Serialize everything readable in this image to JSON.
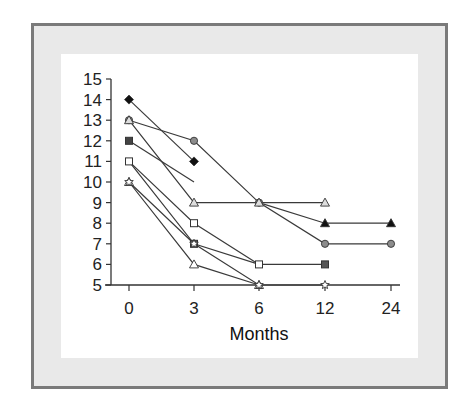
{
  "chart_data": {
    "type": "line",
    "title": "",
    "xlabel": "Months",
    "ylabel": "",
    "x": [
      "0",
      "3",
      "6",
      "12",
      "24"
    ],
    "x_ticks": [
      "0",
      "3",
      "6",
      "12",
      "24"
    ],
    "y_ticks": [
      "5",
      "6",
      "7",
      "8",
      "9",
      "10",
      "11",
      "12",
      "13",
      "14",
      "15"
    ],
    "ylim": [
      5,
      15
    ],
    "grid": false,
    "legend": "none",
    "series": [
      {
        "name": "black-diamond",
        "marker": "diamond",
        "fill": "#111111",
        "points": [
          [
            0,
            14
          ],
          [
            3,
            11
          ]
        ]
      },
      {
        "name": "gray-circle",
        "marker": "circle",
        "fill": "#8c8c8c",
        "points": [
          [
            0,
            13
          ],
          [
            3,
            12
          ],
          [
            6,
            9
          ],
          [
            12,
            7
          ],
          [
            24,
            7
          ]
        ]
      },
      {
        "name": "gray-triangle-open",
        "marker": "triangle",
        "fill": "#dddddd",
        "points": [
          [
            0,
            13
          ],
          [
            3,
            9
          ],
          [
            6,
            9
          ],
          [
            12,
            9
          ]
        ]
      },
      {
        "name": "dark-square-partial",
        "marker": "square",
        "fill": "#444444",
        "points": [
          [
            0,
            12
          ],
          [
            3,
            10
          ]
        ],
        "marker_at": [
          0
        ]
      },
      {
        "name": "open-square",
        "marker": "square",
        "fill": "#ffffff",
        "points": [
          [
            0,
            11
          ],
          [
            3,
            8
          ],
          [
            6,
            6
          ]
        ]
      },
      {
        "name": "dark-square",
        "marker": "square",
        "fill": "#555555",
        "points": [
          [
            0,
            11
          ],
          [
            3,
            7
          ],
          [
            6,
            6
          ],
          [
            12,
            6
          ]
        ],
        "marker_at": [
          1,
          3
        ]
      },
      {
        "name": "open-triangle",
        "marker": "triangle",
        "fill": "#ffffff",
        "points": [
          [
            0,
            10
          ],
          [
            3,
            6
          ],
          [
            6,
            5
          ]
        ]
      },
      {
        "name": "open-star",
        "marker": "star",
        "fill": "#ffffff",
        "points": [
          [
            0,
            10
          ],
          [
            3,
            7
          ],
          [
            6,
            5
          ],
          [
            12,
            5
          ]
        ]
      },
      {
        "name": "black-triangle",
        "marker": "triangle",
        "fill": "#111111",
        "points": [
          [
            6,
            9
          ],
          [
            12,
            8
          ],
          [
            24,
            8
          ]
        ],
        "marker_at": [
          1,
          2
        ]
      }
    ]
  }
}
